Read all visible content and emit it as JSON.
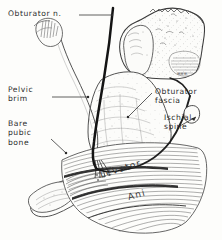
{
  "figure": {
    "background_color": "#fdfdfb",
    "ink_color": "#2b2b2b",
    "nerve_color": "#1a1a1a",
    "hatch_color": "#555555"
  },
  "labels": {
    "obturator_nerve": {
      "lines": [
        "Obturator n."
      ],
      "line1": "Obturator n."
    },
    "pelvic_brim": {
      "lines": [
        "Pelvic",
        "brim"
      ],
      "line1": "Pelvic",
      "line2": "brim"
    },
    "bare_pubic_bone": {
      "lines": [
        "Bare",
        "pubic",
        "bone"
      ],
      "line1": "Bare",
      "line2": "pubic",
      "line3": "bone"
    },
    "obturator_fascia": {
      "lines": [
        "Obturator",
        "fascia"
      ],
      "line1": "Obturator",
      "line2": "fascia"
    },
    "ischial_spine": {
      "lines": [
        "Ischial",
        "spine"
      ],
      "line1": "Ischial",
      "line2": "spine"
    }
  },
  "inline_annotations": {
    "levator": "Levator",
    "ani": "Ani"
  }
}
